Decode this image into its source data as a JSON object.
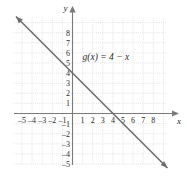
{
  "chart_data": {
    "type": "line",
    "title": "",
    "xlabel": "x",
    "ylabel": "y",
    "xlim": [
      -6,
      9.8
    ],
    "ylim": [
      -5.8,
      8.8
    ],
    "grid": true,
    "grid_style": "dotted",
    "legend": "none",
    "annotations": [
      {
        "text": "g(x) = 4 − x",
        "x": 1.0,
        "y": 5.3
      }
    ],
    "x_tick_labels": [
      "–5",
      "–4",
      "–3",
      "–2",
      "–1",
      "1",
      "2",
      "3",
      "4",
      "5",
      "6",
      "7",
      "8"
    ],
    "x_tick_values": [
      -5,
      -4,
      -3,
      -2,
      -1,
      1,
      2,
      3,
      4,
      5,
      6,
      7,
      8
    ],
    "y_tick_labels": [
      "8",
      "7",
      "6",
      "5",
      "4",
      "3",
      "2",
      "1",
      "–1",
      "–2",
      "–3",
      "–4",
      "–5"
    ],
    "y_tick_values": [
      8,
      7,
      6,
      5,
      4,
      3,
      2,
      1,
      -1,
      -2,
      -3,
      -4,
      -5
    ],
    "series": [
      {
        "name": "g(x) = 4 − x",
        "equation": "y = 4 - x",
        "slope": -1,
        "intercept": 4,
        "x_intercept": 4,
        "y_intercept": 4,
        "x": [
          -5.6,
          9.4
        ],
        "values": [
          9.6,
          -5.4
        ],
        "color": "#6b6b6b",
        "arrow_start": true,
        "arrow_end": true
      }
    ],
    "colors": {
      "axis": "#7a7a7a",
      "grid": "#d8d8d8",
      "line": "#6e6e6e",
      "text": "#2b2b2b",
      "background": "#ffffff"
    }
  },
  "axes": {
    "x_name": "x",
    "y_name": "y"
  }
}
